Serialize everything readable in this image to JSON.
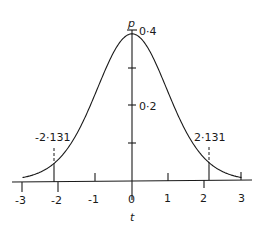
{
  "chart_data": {
    "type": "line",
    "title": "",
    "xlabel": "t",
    "ylabel": "p",
    "xlim": [
      -3,
      3
    ],
    "ylim": [
      0,
      0.4
    ],
    "grid": false,
    "legend": null,
    "x_ticks": [
      -3,
      -2,
      -1,
      0,
      1,
      2,
      3
    ],
    "x_tick_labels": [
      "-3",
      "-2",
      "-1",
      "0",
      "1",
      "2",
      "3"
    ],
    "y_ticks": [
      0.1,
      0.2,
      0.3,
      0.4
    ],
    "y_tick_labels": [
      "",
      "0·2",
      "",
      "0·4"
    ],
    "series": [
      {
        "name": "t-distribution density (15 d.f.)",
        "x": [
          -3.0,
          -2.5,
          -2.131,
          -2.0,
          -1.5,
          -1.0,
          -0.5,
          0.0,
          0.5,
          1.0,
          1.5,
          2.0,
          2.131,
          2.5,
          3.0
        ],
        "y": [
          0.009,
          0.024,
          0.042,
          0.051,
          0.125,
          0.232,
          0.344,
          0.394,
          0.344,
          0.232,
          0.125,
          0.051,
          0.042,
          0.024,
          0.009
        ]
      }
    ],
    "annotations": [
      {
        "x": -2.131,
        "label": "-2·131",
        "style": "dashed vertical marker"
      },
      {
        "x": 2.131,
        "label": "2·131",
        "style": "dashed vertical marker"
      }
    ],
    "df": 15
  },
  "labels": {
    "x_axis": "t",
    "y_axis": "p",
    "y_04": "0·4",
    "y_02": "0·2",
    "crit_left": "-2·131",
    "crit_right": "2·131",
    "x_m3": "-3",
    "x_m2": "-2",
    "x_m1": "-1",
    "x_0": "0",
    "x_1": "1",
    "x_2": "2",
    "x_3": "3"
  }
}
